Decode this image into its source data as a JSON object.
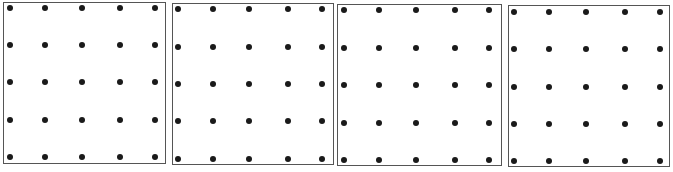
{
  "figure": {
    "grid_rows": 5,
    "grid_cols": 5,
    "dot_color": "#1a1a1a",
    "border_color": "#555555",
    "panels": [
      {
        "id": "panel-1",
        "box": {
          "left": 3,
          "top": 2,
          "width": 163,
          "height": 162
        },
        "cols_x": [
          10,
          45,
          82,
          120,
          155
        ],
        "rows_y": [
          8,
          45,
          82,
          120,
          157
        ]
      },
      {
        "id": "panel-2",
        "box": {
          "left": 172,
          "top": 3,
          "width": 162,
          "height": 162
        },
        "cols_x": [
          178,
          213,
          249,
          288,
          322
        ],
        "rows_y": [
          9,
          47,
          84,
          121,
          159
        ]
      },
      {
        "id": "panel-3",
        "box": {
          "left": 337,
          "top": 4,
          "width": 165,
          "height": 162
        },
        "cols_x": [
          344,
          379,
          416,
          455,
          489
        ],
        "rows_y": [
          10,
          48,
          85,
          123,
          160
        ]
      },
      {
        "id": "panel-4",
        "box": {
          "left": 508,
          "top": 5,
          "width": 162,
          "height": 162
        },
        "cols_x": [
          514,
          549,
          586,
          625,
          660
        ],
        "rows_y": [
          12,
          49,
          87,
          124,
          161
        ]
      }
    ]
  }
}
